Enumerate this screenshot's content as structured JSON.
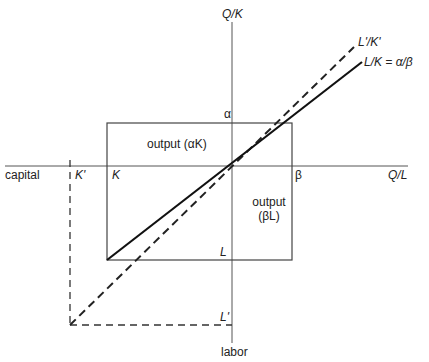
{
  "diagram": {
    "type": "production-function-isoquant",
    "colors": {
      "background": "#ffffff",
      "axis": "#555555",
      "box": "#444444",
      "solid_ray": "#111111",
      "dashed_ray": "#222222",
      "text": "#222222"
    },
    "axes": {
      "vertical_top_label": "Q/K",
      "vertical_bottom_label": "labor",
      "horizontal_left_label": "capital",
      "horizontal_right_label": "Q/L"
    },
    "tick_labels": {
      "alpha": "α",
      "beta": "β",
      "K": "K",
      "K_prime": "K'",
      "L": "L",
      "L_prime": "L'"
    },
    "regions": {
      "output_alpha_K": "output (αK)",
      "output_beta_L_line1": "output",
      "output_beta_L_line2": "(βL)"
    },
    "rays": {
      "solid_label": "L/K = α/β",
      "dashed_label": "L'/K'"
    }
  }
}
